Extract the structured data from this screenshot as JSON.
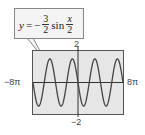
{
  "chart_data": {
    "type": "line",
    "title": "",
    "equation": {
      "lhs": "y",
      "eq": "=",
      "sign": "−",
      "coef_num": "3",
      "coef_den": "2",
      "func": "sin",
      "arg_num": "x",
      "arg_den": "2",
      "text": "y = -3/2 sin x/2"
    },
    "series": [
      {
        "name": "y = -3/2 sin(x/2)",
        "amplitude": 1.5,
        "period": "4π",
        "formula": "-1.5*sin(x/2)"
      }
    ],
    "xlim": [
      -25.1327,
      25.1327
    ],
    "ylim": [
      -2,
      2
    ],
    "x_tick_labels": {
      "min": "−8π",
      "max": "8π"
    },
    "y_tick_labels": {
      "max": "2",
      "min": "−2"
    },
    "grid": false,
    "legend": "callout box at top-left"
  },
  "colors": {
    "plot_bg": "#e6e6e6",
    "frame": "#555555",
    "curve": "#444444",
    "axis": "#333333",
    "callout_bg": "#f4f4f4"
  }
}
